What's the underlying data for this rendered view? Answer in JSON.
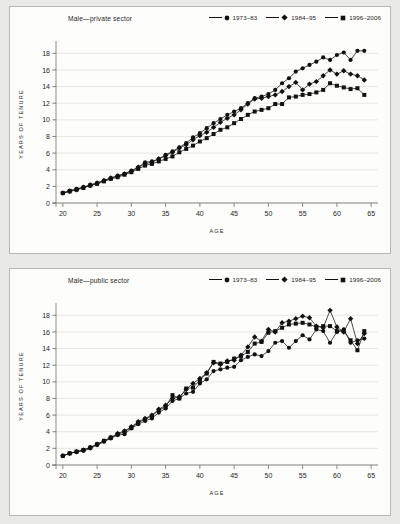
{
  "page": {
    "background_color": "#e9e9e7",
    "panel_background": "#fdfdfc",
    "panel_border_color": "#b9b8b4",
    "ink_color": "#111111",
    "gridline_color": "#dededa"
  },
  "legend": {
    "items": [
      {
        "label": "1973–83",
        "marker": "circle-marker"
      },
      {
        "label": "1984–95",
        "marker": "diamond-marker"
      },
      {
        "label": "1996–2006",
        "marker": "square-marker"
      }
    ]
  },
  "axes": {
    "xlabel": "AGE",
    "ylabel": "YEARS OF TENURE",
    "xticks": [
      "20",
      "25",
      "30",
      "35",
      "40",
      "45",
      "50",
      "55",
      "60",
      "65"
    ],
    "yticks": [
      "0",
      "2",
      "4",
      "6",
      "8",
      "10",
      "12",
      "14",
      "16",
      "18"
    ]
  },
  "chart_data": [
    {
      "type": "line",
      "title": "Male—private sector",
      "xlabel": "AGE",
      "ylabel": "YEARS OF TENURE",
      "xlim": [
        19,
        66
      ],
      "ylim": [
        0,
        19
      ],
      "grid": true,
      "legend_position": "top-right",
      "x": [
        20,
        21,
        22,
        23,
        24,
        25,
        26,
        27,
        28,
        29,
        30,
        31,
        32,
        33,
        34,
        35,
        36,
        37,
        38,
        39,
        40,
        41,
        42,
        43,
        44,
        45,
        46,
        47,
        48,
        49,
        50,
        51,
        52,
        53,
        54,
        55,
        56,
        57,
        58,
        59,
        60,
        61,
        62,
        63,
        64
      ],
      "series": [
        {
          "name": "1973–83",
          "marker": "circle",
          "values": [
            1.2,
            1.5,
            1.7,
            1.9,
            2.2,
            2.4,
            2.7,
            3.0,
            3.3,
            3.5,
            3.9,
            4.3,
            4.9,
            5.0,
            5.3,
            5.8,
            6.2,
            6.7,
            7.2,
            7.9,
            8.4,
            9.0,
            9.6,
            10.1,
            10.6,
            11.0,
            11.4,
            12.0,
            12.6,
            12.8,
            13.1,
            13.6,
            14.4,
            15.0,
            15.8,
            16.2,
            16.6,
            17.0,
            17.5,
            17.2,
            17.8,
            18.1,
            17.2,
            18.3,
            18.3
          ]
        },
        {
          "name": "1984–95",
          "marker": "diamond",
          "values": [
            1.2,
            1.4,
            1.6,
            1.9,
            2.1,
            2.4,
            2.7,
            3.0,
            3.2,
            3.5,
            3.8,
            4.3,
            4.7,
            4.9,
            5.3,
            5.7,
            6.1,
            6.6,
            7.0,
            7.6,
            8.1,
            8.5,
            9.1,
            9.7,
            10.2,
            10.6,
            11.2,
            11.9,
            12.5,
            12.6,
            12.8,
            13.0,
            13.4,
            14.0,
            14.5,
            13.6,
            14.3,
            14.6,
            15.3,
            16.0,
            15.5,
            15.9,
            15.5,
            15.3,
            14.8
          ]
        },
        {
          "name": "1996–2006",
          "marker": "square",
          "values": [
            1.2,
            1.4,
            1.6,
            1.8,
            2.1,
            2.3,
            2.6,
            2.9,
            3.1,
            3.4,
            3.7,
            4.1,
            4.5,
            4.7,
            5.0,
            5.3,
            5.6,
            6.1,
            6.5,
            6.9,
            7.4,
            7.8,
            8.3,
            8.8,
            9.1,
            9.6,
            10.1,
            10.6,
            11.0,
            11.2,
            11.4,
            11.9,
            11.9,
            12.7,
            12.8,
            13.0,
            13.1,
            13.3,
            13.6,
            14.4,
            14.1,
            13.9,
            13.7,
            13.8,
            13.0
          ]
        }
      ]
    },
    {
      "type": "line",
      "title": "Male—public sector",
      "xlabel": "AGE",
      "ylabel": "YEARS OF TENURE",
      "xlim": [
        19,
        66
      ],
      "ylim": [
        0,
        19
      ],
      "grid": true,
      "legend_position": "top-right",
      "x": [
        20,
        21,
        22,
        23,
        24,
        25,
        26,
        27,
        28,
        29,
        30,
        31,
        32,
        33,
        34,
        35,
        36,
        37,
        38,
        39,
        40,
        41,
        42,
        43,
        44,
        45,
        46,
        47,
        48,
        49,
        50,
        51,
        52,
        53,
        54,
        55,
        56,
        57,
        58,
        59,
        60,
        61,
        62,
        63,
        64
      ],
      "series": [
        {
          "name": "1973–83",
          "marker": "circle",
          "values": [
            1.1,
            1.4,
            1.6,
            1.7,
            2.0,
            2.4,
            2.8,
            3.2,
            3.6,
            3.7,
            4.4,
            4.9,
            5.3,
            5.6,
            6.3,
            6.8,
            7.7,
            8.0,
            8.6,
            8.8,
            9.8,
            10.3,
            11.3,
            11.5,
            11.7,
            11.8,
            12.6,
            13.0,
            13.3,
            13.1,
            13.7,
            14.7,
            14.9,
            14.1,
            14.9,
            15.6,
            15.1,
            16.3,
            16.1,
            14.7,
            16.0,
            16.3,
            14.7,
            15.0,
            15.2
          ]
        },
        {
          "name": "1984–95",
          "marker": "diamond",
          "values": [
            1.1,
            1.4,
            1.6,
            1.8,
            2.1,
            2.5,
            2.9,
            3.3,
            3.8,
            4.1,
            4.6,
            5.2,
            5.6,
            6.0,
            6.7,
            7.2,
            8.0,
            8.2,
            9.1,
            9.8,
            10.4,
            11.1,
            12.3,
            12.1,
            12.5,
            12.6,
            13.2,
            14.2,
            15.4,
            14.9,
            16.3,
            16.0,
            17.1,
            17.3,
            17.6,
            17.9,
            17.7,
            16.7,
            16.5,
            18.6,
            16.6,
            16.0,
            17.6,
            14.6,
            15.8
          ]
        },
        {
          "name": "1996–2006",
          "marker": "square",
          "values": [
            1.1,
            1.4,
            1.6,
            1.8,
            2.1,
            2.5,
            2.9,
            3.3,
            3.7,
            4.0,
            4.5,
            5.1,
            5.5,
            5.9,
            6.6,
            7.0,
            8.4,
            8.0,
            9.2,
            9.3,
            10.2,
            11.0,
            12.4,
            12.2,
            12.4,
            12.8,
            13.1,
            13.6,
            14.6,
            14.8,
            15.9,
            16.1,
            16.5,
            16.9,
            17.0,
            17.1,
            16.9,
            16.6,
            16.7,
            16.7,
            16.1,
            16.1,
            15.0,
            13.8,
            16.1
          ]
        }
      ]
    }
  ]
}
